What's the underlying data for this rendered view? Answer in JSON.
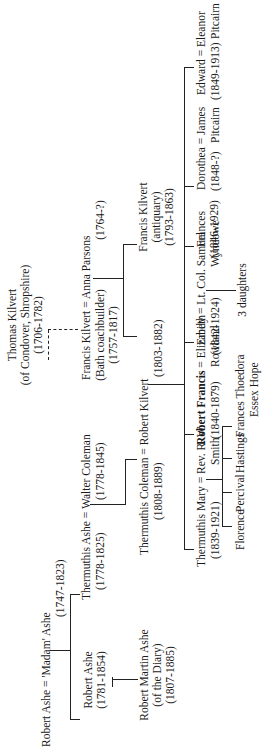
{
  "tree": {
    "thomas_kilvert": {
      "name": "Thomas Kilvert",
      "note": "(of Condover, Shropshire)",
      "dates": "(1706-1782)"
    },
    "robert_ashe_sr": {
      "name": "Robert Ashe",
      "spouse_sep": "=",
      "spouse": "'Madam' Ashe",
      "spouse_dates": "(1747-1823)"
    },
    "francis_kilvert_coach": {
      "name": "Francis Kilvert",
      "note": "(Bath coachbuilder)",
      "dates": "(1757-1817)",
      "spouse_sep": "=",
      "spouse": "Anna Parsons",
      "spouse_dates": "(1764-?)"
    },
    "robert_ashe_jr": {
      "name": "Robert Ashe",
      "dates": "(1781-1854)"
    },
    "thermuthis_ashe": {
      "name": "Thermuthis Ashe",
      "dates": "(1778-1825)",
      "spouse_sep": "=",
      "spouse": "Walter Coleman",
      "spouse_dates": "(1778-1845)"
    },
    "robert_martin_ashe": {
      "name": "Robert Martin Ashe",
      "note": "(of the Diary)",
      "dates": "(1807-1885)"
    },
    "thermuthis_coleman": {
      "name": "Thermuthis Coleman",
      "dates": "(1808-1889)",
      "spouse_sep": "=",
      "spouse": "Robert Kilvert",
      "spouse_dates": "(1803-1882)"
    },
    "francis_kilvert_antiquary": {
      "name": "Francis Kilvert",
      "note": "(antiquary)",
      "dates": "(1793-1863)"
    },
    "children": [
      {
        "name": "Thermuthis Mary",
        "dates": "(1839-1921)",
        "spouse_sep": "=",
        "spouse": "Rev. R. W.",
        "spouse2": "Smith"
      },
      {
        "name": "Robert Francis",
        "dates": "(1840-1879)",
        "spouse_sep": "=",
        "spouse": "Elizabeth",
        "spouse2": "Rowland",
        "bold": true
      },
      {
        "name": "Emily",
        "dates": "(1842-1924)",
        "spouse_sep": "=",
        "spouse": "Lt. Col. Samuel",
        "spouse2": "Wyndowe"
      },
      {
        "name": "Frances",
        "dates": "(1846-1929)"
      },
      {
        "name": "Dorothea",
        "dates": "(1848-?)",
        "spouse_sep": "=",
        "spouse": "James",
        "spouse2": "Pitcairn"
      },
      {
        "name": "Edward",
        "dates": "(1849-1913)",
        "spouse_sep": "=",
        "spouse": "Eleanor",
        "spouse2": "Pitcairn"
      }
    ],
    "smith_children": [
      "Florence",
      "Percival",
      "Hastings",
      "Frances Thoedora",
      "Essex Hope"
    ],
    "wyndowe_children": "3 daughters"
  }
}
